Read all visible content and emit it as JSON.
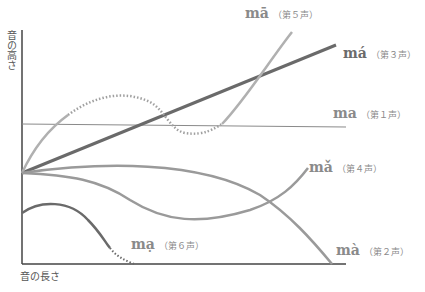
{
  "axes": {
    "y_label": "音の高さ",
    "x_label": "音の長さ"
  },
  "tones": [
    {
      "syllable": "mā",
      "label": "（第５声）",
      "style": "light-dotted"
    },
    {
      "syllable": "má",
      "label": "（第３声）",
      "style": "dark"
    },
    {
      "syllable": "ma",
      "label": "（第１声）",
      "style": "thin"
    },
    {
      "syllable": "mǎ",
      "label": "（第４声）",
      "style": "medium"
    },
    {
      "syllable": "mà",
      "label": "（第２声）",
      "style": "medium"
    },
    {
      "syllable": "mạ",
      "label": "（第６声）",
      "style": "dark-dotted"
    }
  ],
  "colors": {
    "axis": "#444444",
    "dark_line": "#6a6a6a",
    "medium_line": "#9a9a9a",
    "light_line": "#b0b0b0",
    "label_text": "#8a8a8a"
  }
}
